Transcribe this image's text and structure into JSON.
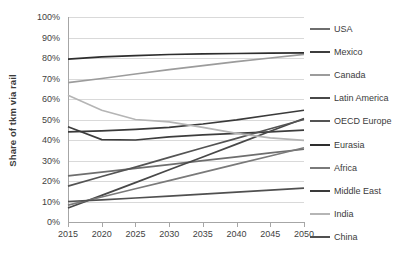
{
  "chart_data": {
    "type": "line",
    "title": "",
    "xlabel": "",
    "ylabel": "Share of tkm via rail",
    "x": [
      2015,
      2020,
      2025,
      2030,
      2035,
      2040,
      2045,
      2050
    ],
    "xlim": [
      2015,
      2050
    ],
    "ylim": [
      0,
      1.0
    ],
    "y_tick_labels": [
      "100%",
      "90%",
      "80%",
      "70%",
      "60%",
      "50%",
      "40%",
      "30%",
      "20%",
      "10%",
      "0%"
    ],
    "y_tick_values": [
      1.0,
      0.9,
      0.8,
      0.7,
      0.6,
      0.5,
      0.4,
      0.3,
      0.2,
      0.1,
      0.0
    ],
    "x_tick_labels": [
      "2015",
      "2020",
      "2025",
      "2030",
      "2035",
      "2040",
      "2045",
      "2050"
    ],
    "grid": true,
    "legend_position": "right",
    "series": [
      {
        "name": "USA",
        "color": "#6e6e6e",
        "values": [
          0.225,
          0.243,
          0.262,
          0.28,
          0.299,
          0.318,
          0.337,
          0.355
        ]
      },
      {
        "name": "Mexico",
        "color": "#3d3d3d",
        "values": [
          0.465,
          0.402,
          0.4,
          0.415,
          0.425,
          0.432,
          0.44,
          0.448
        ]
      },
      {
        "name": "Canada",
        "color": "#9c9c9c",
        "values": [
          0.68,
          0.7,
          0.722,
          0.743,
          0.763,
          0.782,
          0.8,
          0.818
        ]
      },
      {
        "name": "Latin America",
        "color": "#484848",
        "values": [
          0.068,
          0.13,
          0.192,
          0.255,
          0.317,
          0.38,
          0.443,
          0.505
        ]
      },
      {
        "name": "OECD Europe",
        "color": "#545454",
        "values": [
          0.175,
          0.222,
          0.268,
          0.315,
          0.362,
          0.408,
          0.455,
          0.5
        ]
      },
      {
        "name": "Eurasia",
        "color": "#2e2e2e",
        "values": [
          0.795,
          0.805,
          0.812,
          0.817,
          0.82,
          0.822,
          0.824,
          0.825
        ]
      },
      {
        "name": "Africa",
        "color": "#7a7a7a",
        "values": [
          0.082,
          0.122,
          0.162,
          0.202,
          0.242,
          0.282,
          0.322,
          0.362
        ]
      },
      {
        "name": "Middle East",
        "color": "#3a3a3a",
        "values": [
          0.44,
          0.445,
          0.452,
          0.462,
          0.478,
          0.498,
          0.522,
          0.545
        ]
      },
      {
        "name": "India",
        "color": "#b5b5b5",
        "values": [
          0.618,
          0.545,
          0.5,
          0.488,
          0.462,
          0.432,
          0.41,
          0.398
        ]
      },
      {
        "name": "China",
        "color": "#505050",
        "values": [
          0.1,
          0.108,
          0.117,
          0.126,
          0.136,
          0.146,
          0.155,
          0.165
        ]
      }
    ]
  }
}
